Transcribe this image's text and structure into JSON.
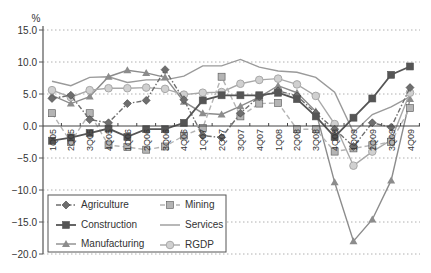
{
  "chart_data": {
    "type": "line",
    "title": "",
    "xlabel": "",
    "ylabel": "%",
    "ylim": [
      -20,
      15
    ],
    "yticks": [
      15.0,
      10.0,
      5.0,
      0.0,
      -5.0,
      -10.0,
      -15.0,
      -20.0
    ],
    "ytick_labels": [
      "15.0",
      "10.0",
      "5.0",
      "0.0",
      "−5.0",
      "−10.0",
      "−15.0",
      "−20.0"
    ],
    "grid": "horizontal dotted",
    "legend_position": "lower left inside",
    "categories": [
      "1Q05",
      "2Q05",
      "3Q05",
      "4Q05",
      "1Q06",
      "2Q06",
      "3Q06",
      "4Q06",
      "1Q07",
      "2Q07",
      "3Q07",
      "4Q07",
      "1Q08",
      "2Q08",
      "3Q08",
      "4Q08",
      "1Q09",
      "2Q09",
      "3Q09",
      "4Q09"
    ],
    "series": [
      {
        "name": "Agriculture",
        "style": "dash-dot",
        "marker": "diamond",
        "color": "#6e6e6e",
        "values": [
          4.3,
          4.8,
          1.0,
          0.5,
          3.5,
          4.0,
          8.8,
          4.1,
          -1.5,
          -1.8,
          2.0,
          4.6,
          5.5,
          4.7,
          2.0,
          -0.5,
          -3.2,
          0.5,
          -0.2,
          6.0
        ]
      },
      {
        "name": "Mining",
        "style": "dashed",
        "marker": "square",
        "color": "#b4b4b4",
        "values": [
          2.0,
          -2.5,
          2.0,
          -3.0,
          -3.3,
          -3.7,
          -3.2,
          -1.5,
          -0.3,
          7.7,
          1.5,
          3.5,
          3.6,
          -0.5,
          -0.5,
          -4.0,
          -3.5,
          -3.0,
          -2.5,
          2.8
        ]
      },
      {
        "name": "Construction",
        "style": "solid",
        "marker": "square",
        "color": "#555555",
        "values": [
          -2.3,
          -1.8,
          -1.1,
          -0.4,
          -1.7,
          -0.5,
          -0.5,
          0.5,
          4.0,
          4.8,
          4.8,
          4.8,
          5.2,
          4.2,
          1.5,
          -1.7,
          1.3,
          4.3,
          8.0,
          9.3
        ]
      },
      {
        "name": "Services",
        "style": "solid",
        "marker": "none",
        "color": "#9a9a9a",
        "values": [
          7.0,
          6.3,
          7.6,
          7.7,
          6.8,
          7.2,
          7.2,
          7.8,
          9.4,
          9.4,
          10.4,
          9.2,
          8.6,
          8.4,
          7.6,
          5.3,
          -1.0,
          1.8,
          3.0,
          4.6
        ]
      },
      {
        "name": "Manufacturing",
        "style": "solid",
        "marker": "triangle",
        "color": "#8c8c8c",
        "values": [
          4.8,
          3.5,
          4.6,
          7.7,
          8.7,
          8.3,
          7.6,
          3.8,
          2.0,
          1.8,
          3.1,
          4.5,
          6.3,
          5.2,
          2.3,
          -8.8,
          -18.0,
          -14.6,
          -8.5,
          4.2
        ]
      },
      {
        "name": "RGDP",
        "style": "solid",
        "marker": "circle",
        "color": "#a8a8a8",
        "values": [
          5.6,
          4.5,
          5.6,
          5.9,
          5.9,
          6.0,
          5.8,
          4.9,
          5.2,
          5.3,
          6.6,
          7.2,
          7.4,
          6.5,
          4.7,
          0.3,
          -6.2,
          -4.0,
          -2.2,
          5.2
        ]
      }
    ]
  },
  "axis": {
    "y_unit": "%"
  },
  "legend": {
    "items": [
      {
        "label": "Agriculture"
      },
      {
        "label": "Mining"
      },
      {
        "label": "Construction"
      },
      {
        "label": "Services"
      },
      {
        "label": "Manufacturing"
      },
      {
        "label": "RGDP"
      }
    ]
  }
}
